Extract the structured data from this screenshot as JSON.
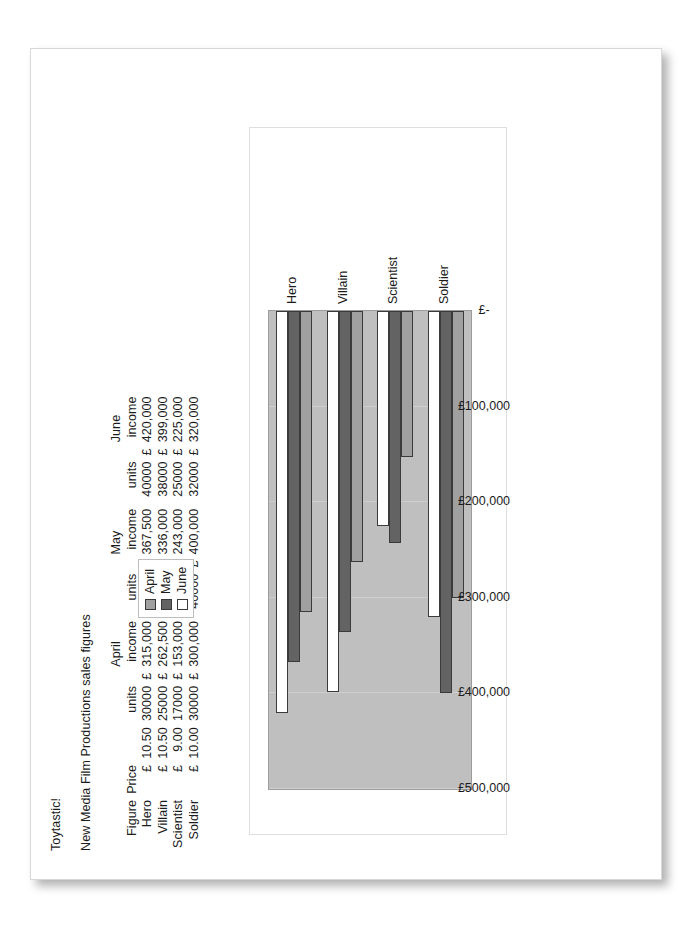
{
  "document": {
    "heading": "Toytastic!",
    "subheading": "New Media Film Productions sales figures"
  },
  "table": {
    "month_headers": [
      "April",
      "May",
      "June"
    ],
    "column_headers": [
      "Figure",
      "Price",
      "units",
      "income",
      "units",
      "income",
      "units",
      "income"
    ],
    "currency_symbol": "£",
    "rows": [
      {
        "figure": "Hero",
        "price": "10.50",
        "april_units": "30000",
        "april_income": "315,000",
        "may_units": "35000",
        "may_income": "367,500",
        "june_units": "40000",
        "june_income": "420,000"
      },
      {
        "figure": "Villain",
        "price": "10.50",
        "april_units": "25000",
        "april_income": "262,500",
        "may_units": "32000",
        "may_income": "336,000",
        "june_units": "38000",
        "june_income": "399,000"
      },
      {
        "figure": "Scientist",
        "price": "9.00",
        "april_units": "17000",
        "april_income": "153,000",
        "may_units": "27000",
        "may_income": "243,000",
        "june_units": "25000",
        "june_income": "225,000"
      },
      {
        "figure": "Soldier",
        "price": "10.00",
        "april_units": "30000",
        "april_income": "300,000",
        "may_units": "40000",
        "may_income": "400,000",
        "june_units": "32000",
        "june_income": "320,000"
      }
    ]
  },
  "legend": {
    "items": [
      {
        "label": "April",
        "color": "#a0a0a0"
      },
      {
        "label": "May",
        "color": "#636363"
      },
      {
        "label": "June",
        "color": "#ffffff"
      }
    ]
  },
  "axis": {
    "tick_labels": [
      "£-",
      "£100,000",
      "£200,000",
      "£300,000",
      "£400,000",
      "£500,000"
    ]
  },
  "chart_data": {
    "type": "bar",
    "orientation": "horizontal",
    "title": "",
    "xlabel": "",
    "ylabel": "",
    "categories": [
      "Hero",
      "Villain",
      "Scientist",
      "Soldier"
    ],
    "series": [
      {
        "name": "April",
        "color": "#a0a0a0",
        "values": [
          315000,
          262500,
          153000,
          300000
        ]
      },
      {
        "name": "May",
        "color": "#636363",
        "values": [
          367500,
          336000,
          243000,
          400000
        ]
      },
      {
        "name": "June",
        "color": "#ffffff",
        "values": [
          420000,
          399000,
          225000,
          320000
        ]
      }
    ],
    "ylim": [
      0,
      500000
    ],
    "tick_step": 100000,
    "grid": true,
    "legend_position": "top-right",
    "plot_background": "#bfbfbf"
  }
}
